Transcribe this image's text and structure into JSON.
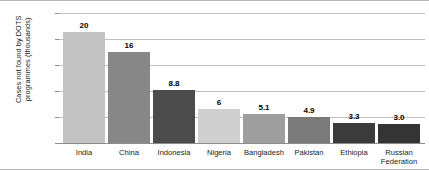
{
  "chart_data": {
    "type": "bar",
    "title": "",
    "xlabel": "",
    "ylabel": "Cases not found by DOTS\nprogrammes (thousands)",
    "ylim": [
      0,
      500
    ],
    "yticks": [
      0,
      100,
      200,
      300,
      400,
      500
    ],
    "ytick_labels": [
      "0",
      "100",
      "200",
      "300",
      "400",
      "500"
    ],
    "grid": true,
    "legend": "none",
    "categories": [
      "India",
      "China",
      "Indonesia",
      "Nigeria",
      "Bangladesh",
      "Pakistan",
      "Ethiopia",
      "Russian\nFederation"
    ],
    "values": [
      427,
      350,
      205,
      130,
      110,
      100,
      77,
      75
    ],
    "data_labels": [
      "20",
      "16",
      "8.8",
      "6",
      "5.1",
      "4.9",
      "3.3",
      "3.0"
    ],
    "bar_colors": [
      "#c3c3c3",
      "#878787",
      "#4b4b4b",
      "#cfcfcf",
      "#9e9e9e",
      "#7a7a7a",
      "#3b3b3b",
      "#343434"
    ],
    "bars": [
      {
        "category": "India",
        "value": 427,
        "label": "20",
        "color": "#c3c3c3"
      },
      {
        "category": "China",
        "value": 350,
        "label": "16",
        "color": "#878787"
      },
      {
        "category": "Indonesia",
        "value": 205,
        "label": "8.8",
        "color": "#4b4b4b"
      },
      {
        "category": "Nigeria",
        "value": 130,
        "label": "6",
        "color": "#cfcfcf"
      },
      {
        "category": "Bangladesh",
        "value": 110,
        "label": "5.1",
        "color": "#9e9e9e"
      },
      {
        "category": "Pakistan",
        "value": 100,
        "label": "4.9",
        "color": "#7a7a7a"
      },
      {
        "category": "Ethiopia",
        "value": 77,
        "label": "3.3",
        "color": "#3b3b3b"
      },
      {
        "category": "Russian\nFederation",
        "value": 75,
        "label": "3.0",
        "color": "#343434"
      }
    ]
  }
}
